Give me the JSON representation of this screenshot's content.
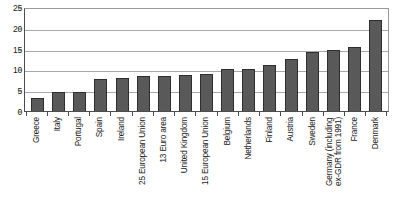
{
  "chart_data": {
    "type": "bar",
    "title": "",
    "subtitle": "",
    "xlabel": "",
    "ylabel": "",
    "ylim": [
      0,
      25
    ],
    "y_ticks": [
      0,
      5,
      10,
      15,
      20,
      25
    ],
    "y_tick_labels": [
      "0",
      "5",
      "10",
      "15",
      "20",
      "25"
    ],
    "grid": true,
    "legend": false,
    "legend_position": "none",
    "orientation": "vertical",
    "sorted": "ascending",
    "bar_color": "#595959",
    "bar_border_color": "#2e2e2e",
    "gridline_color": "#a8a8a8",
    "axis_color": "#4d4d4d",
    "plot_border_color": "#9a9a9a",
    "background_color": "#ffffff",
    "categories": [
      "Greece",
      "Italy",
      "Portugal",
      "Spain",
      "Ireland",
      "25 European Union",
      "13 Euro area",
      "United Kingdom",
      "15 European Union",
      "Belgium",
      "Netherlands",
      "Finland",
      "Austria",
      "Sweden",
      "Germany (including\nex-GDR from 1991)",
      "France",
      "Denmark"
    ],
    "values": [
      3.1,
      4.5,
      4.5,
      7.8,
      8.0,
      8.5,
      8.5,
      8.7,
      9.0,
      10.0,
      10.1,
      11.0,
      12.4,
      14.3,
      14.6,
      15.4,
      21.8
    ],
    "annotations": []
  }
}
